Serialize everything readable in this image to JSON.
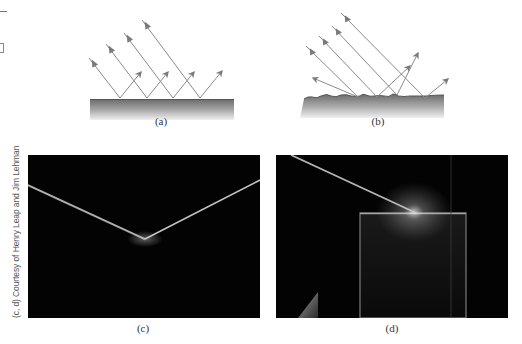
{
  "figure": {
    "panels": [
      {
        "id": "a",
        "label": "(a)",
        "description": "Specular reflection of parallel rays from a smooth surface"
      },
      {
        "id": "b",
        "label": "(b)",
        "description": "Diffuse reflection of parallel rays from a rough surface"
      },
      {
        "id": "c",
        "label": "(c)",
        "description": "Photograph of light beam reflecting from a smooth surface"
      },
      {
        "id": "d",
        "label": "(d)",
        "description": "Photograph of light beam striking a rough surface"
      }
    ],
    "credit": "(c, d) Courtesy of Henry Leap and Jim Lehman",
    "colors": {
      "ray": "#8a8a8a",
      "arrowhead": "#7a7a7a",
      "surface_top": "#6e6e6e",
      "surface_bottom": "#ededed",
      "photo_bg": "#030303",
      "beam": "#d8d8d8"
    }
  }
}
